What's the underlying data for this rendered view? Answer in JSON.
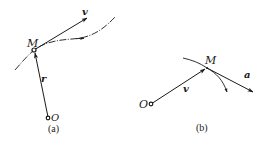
{
  "figure": {
    "panels": [
      {
        "id": "a",
        "caption": "(a)",
        "labels": {
          "point": "M",
          "origin": "O",
          "velocity": "v",
          "position": "r"
        }
      },
      {
        "id": "b",
        "caption": "(b)",
        "labels": {
          "point": "M",
          "origin": "O",
          "velocity": "v",
          "acceleration": "a"
        }
      }
    ],
    "colors": {
      "stroke": "#1a1a1a",
      "background": "#ffffff"
    }
  }
}
